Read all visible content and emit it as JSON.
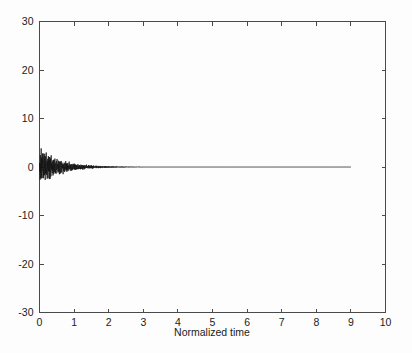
{
  "chart_data": {
    "type": "line",
    "title": "",
    "subtitle": "",
    "xlabel": "Normalized time",
    "ylabel": "",
    "xlim": [
      0,
      10
    ],
    "ylim": [
      -30,
      30
    ],
    "xticks": [
      0,
      1,
      2,
      3,
      4,
      5,
      6,
      7,
      8,
      9,
      10
    ],
    "xtick_labels": [
      "0",
      "1",
      "2",
      "3",
      "4",
      "5",
      "6",
      "7",
      "8",
      "9",
      "10"
    ],
    "yticks": [
      -30,
      -20,
      -10,
      0,
      10,
      20,
      30
    ],
    "ytick_labels": [
      "-30",
      "-20",
      "-10",
      "0",
      "10",
      "20",
      "30"
    ],
    "grid": false,
    "legend": null,
    "legend_position": "none",
    "box": true,
    "tick_direction": "in",
    "annotations": [],
    "series": [
      {
        "name": "damped oscillation",
        "color": "#141414",
        "x_start": 0,
        "x_end": 9.0,
        "description": "High-frequency damped oscillatory transient: amplitude peaks near +/-3.2 just after t=0, decays approximately exponentially to negligible by t~3, then remains flat at 0 until the trace ends at t=9.",
        "envelope_peak": 3.2,
        "envelope_decay_time_constant": 0.62,
        "oscillation_frequency_normalized": 48,
        "flat_after": 3.0,
        "sample_count": 3600
      }
    ]
  },
  "figure": {
    "background_color": "#fdfdfd",
    "axis_color": "#4a4a4a",
    "text_color": "#1b1b1b",
    "series_color": "#141414"
  }
}
